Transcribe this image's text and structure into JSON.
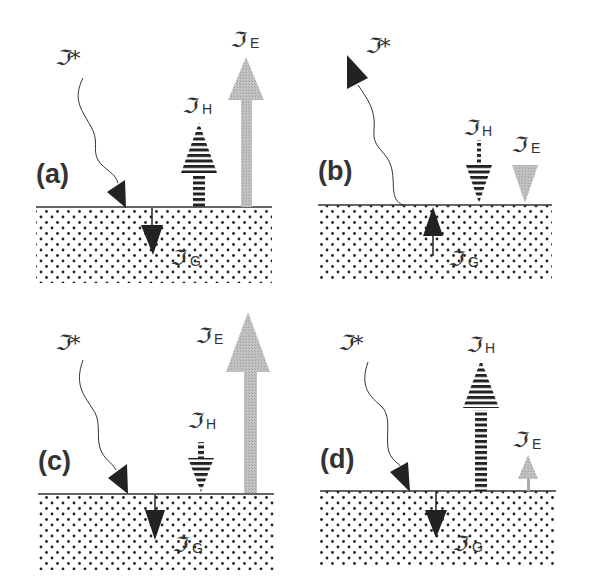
{
  "figure": {
    "symbol_glyph": "ℑ",
    "colors": {
      "ground_dots": "#222222",
      "surface_line": "#333333",
      "radiation_arrow": "#222222",
      "sensible_heat_stripe": "#222222",
      "latent_heat_fill": "#b8b8b8",
      "ground_flux_arrow": "#222222"
    },
    "legend_terms": {
      "radiation": {
        "symbol": "ℑ",
        "superscript": "*"
      },
      "sensible_heat": {
        "symbol": "ℑ",
        "subscript": "H"
      },
      "latent_heat": {
        "symbol": "ℑ",
        "subscript": "E"
      },
      "ground": {
        "symbol": "ℑ",
        "subscript": "G"
      }
    },
    "panels": [
      {
        "id": "a",
        "label": "(a)",
        "radiation": "down",
        "ground_flux": "down",
        "sensible_heat": {
          "direction": "up",
          "size": "medium"
        },
        "latent_heat": {
          "direction": "up",
          "size": "large"
        },
        "labels": {
          "star": "ℑ*",
          "h_sym": "ℑ",
          "h_sub": "H",
          "e_sym": "ℑ",
          "e_sub": "E",
          "g_sym": "ℑ",
          "g_sub": "G"
        }
      },
      {
        "id": "b",
        "label": "(b)",
        "radiation": "up",
        "ground_flux": "up",
        "sensible_heat": {
          "direction": "down",
          "size": "small"
        },
        "latent_heat": {
          "direction": "down",
          "size": "small"
        },
        "labels": {
          "star": "ℑ*",
          "h_sym": "ℑ",
          "h_sub": "H",
          "e_sym": "ℑ",
          "e_sub": "E",
          "g_sym": "ℑ",
          "g_sub": "G"
        }
      },
      {
        "id": "c",
        "label": "(c)",
        "radiation": "down",
        "ground_flux": "down",
        "sensible_heat": {
          "direction": "down",
          "size": "small"
        },
        "latent_heat": {
          "direction": "up",
          "size": "very large"
        },
        "labels": {
          "star": "ℑ*",
          "h_sym": "ℑ",
          "h_sub": "H",
          "e_sym": "ℑ",
          "e_sub": "E",
          "g_sym": "ℑ",
          "g_sub": "G"
        }
      },
      {
        "id": "d",
        "label": "(d)",
        "radiation": "down",
        "ground_flux": "down",
        "sensible_heat": {
          "direction": "up",
          "size": "large"
        },
        "latent_heat": {
          "direction": "up",
          "size": "small"
        },
        "labels": {
          "star": "ℑ*",
          "h_sym": "ℑ",
          "h_sub": "H",
          "e_sym": "ℑ",
          "e_sub": "E",
          "g_sym": "ℑ",
          "g_sub": "G"
        }
      }
    ]
  }
}
